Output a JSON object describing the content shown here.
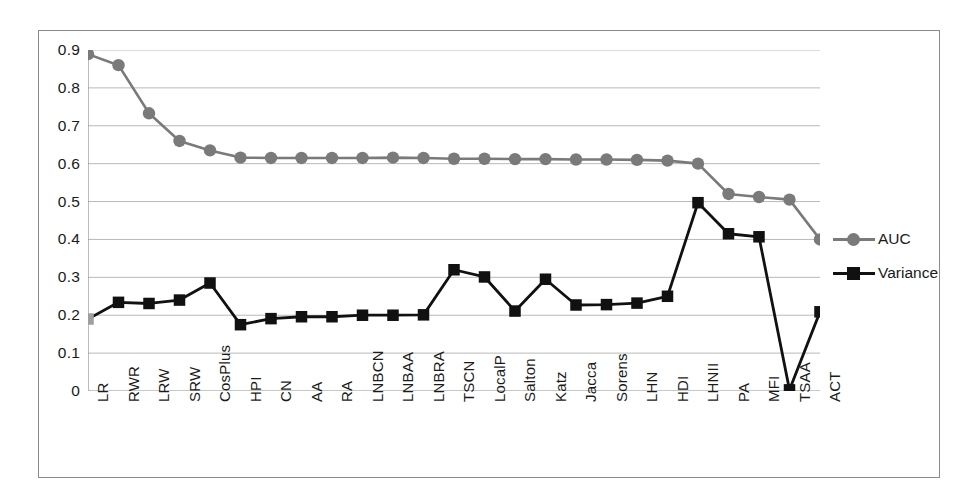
{
  "chart_data": {
    "type": "line",
    "title": "",
    "xlabel": "",
    "ylabel": "",
    "ylim": [
      0,
      0.9
    ],
    "grid": true,
    "legend_position": "right",
    "ytick_labels": [
      "0.9",
      "0.8",
      "0.7",
      "0.6",
      "0.5",
      "0.4",
      "0.3",
      "0.2",
      "0.1",
      "0"
    ],
    "ytick_values": [
      0.9,
      0.8,
      0.7,
      0.6,
      0.5,
      0.4,
      0.3,
      0.2,
      0.1,
      0
    ],
    "categories": [
      "LR",
      "RWR",
      "LRW",
      "SRW",
      "CosPlus",
      "HPI",
      "CN",
      "AA",
      "RA",
      "LNBCN",
      "LNBAA",
      "LNBRA",
      "TSCN",
      "LocalP",
      "Salton",
      "Katz",
      "Jacca",
      "Sorens",
      "LHN",
      "HDI",
      "LHNII",
      "PA",
      "MFI",
      "TSAA",
      "ACT"
    ],
    "series": [
      {
        "name": "AUC",
        "marker": "circle",
        "color": "#7a7a7a",
        "line_color": "#7a7a7a",
        "values": [
          0.889,
          0.86,
          0.733,
          0.66,
          0.635,
          0.616,
          0.615,
          0.615,
          0.615,
          0.615,
          0.616,
          0.615,
          0.613,
          0.613,
          0.612,
          0.612,
          0.611,
          0.611,
          0.61,
          0.608,
          0.6,
          0.52,
          0.512,
          0.505,
          0.4
        ]
      },
      {
        "name": "Variance",
        "marker": "square",
        "color": "#111111",
        "line_color": "#111111",
        "first_point_color": "#9e9e9e",
        "values": [
          0.19,
          0.234,
          0.231,
          0.24,
          0.285,
          0.175,
          0.191,
          0.196,
          0.196,
          0.2,
          0.2,
          0.201,
          0.32,
          0.301,
          0.211,
          0.295,
          0.227,
          0.228,
          0.232,
          0.25,
          0.497,
          0.415,
          0.407,
          0.003,
          0.209
        ]
      }
    ]
  },
  "legend": {
    "items": [
      {
        "label": "AUC",
        "marker": "circle",
        "color": "#7a7a7a"
      },
      {
        "label": "Variance",
        "marker": "square",
        "color": "#111111"
      }
    ]
  },
  "style": {
    "frame_border": "#8a8a8a",
    "gridline_color": "#b9b9b9",
    "axis_color": "#8f8f8f",
    "text_color": "#1a1a1a",
    "background": "#ffffff"
  }
}
